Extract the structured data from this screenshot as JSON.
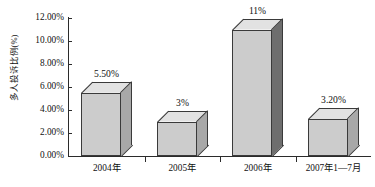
{
  "chart_data": {
    "type": "bar",
    "title": "",
    "subtitle": "",
    "xlabel": "",
    "ylabel": "多人投诉比例(%)",
    "categories": [
      "2004年",
      "2005年",
      "2006年",
      "2007年1—7月"
    ],
    "values": [
      5.5,
      3.0,
      11.0,
      3.2
    ],
    "data_labels": [
      "5.50%",
      "3%",
      "11%",
      "3.20%"
    ],
    "ylim": [
      0,
      12
    ],
    "y_tick_values": [
      0,
      2,
      4,
      6,
      8,
      10,
      12
    ],
    "y_tick_labels": [
      "0.00%",
      "2.00%",
      "4.00%",
      "6.00%",
      "8.00%",
      "10.00%",
      "12.00%"
    ],
    "grid": false,
    "legend": "none",
    "style": "3d-column",
    "series": [
      {
        "name": "多人投诉比例",
        "values": [
          5.5,
          3.0,
          11.0,
          3.2
        ]
      }
    ],
    "colors": {
      "bar_front": "#cccccc",
      "bar_top": "#e2e2e2",
      "bar_side": "#a8a8a8",
      "bar_side_highlight": "#6e6e6e",
      "axis": "#2b2b2b",
      "text": "#111111",
      "background": "#ffffff"
    }
  }
}
